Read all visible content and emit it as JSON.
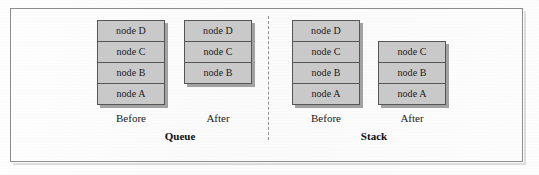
{
  "figure": {
    "background_color": "#fdfdfd",
    "frame_color": "#8c8c8c",
    "divider_style": "dashed-vertical",
    "node_fill_color": "#c9c9c9",
    "node_border_color": "#555555",
    "shadow_color": "#5a5a5a"
  },
  "queue": {
    "title": "Queue",
    "before": {
      "caption": "Before",
      "nodes": [
        "node D",
        "node C",
        "node B",
        "node A"
      ],
      "align": "top"
    },
    "after": {
      "caption": "After",
      "nodes": [
        "node D",
        "node C",
        "node B"
      ],
      "align": "top"
    }
  },
  "stack": {
    "title": "Stack",
    "before": {
      "caption": "Before",
      "nodes": [
        "node D",
        "node C",
        "node B",
        "node A"
      ],
      "align": "top"
    },
    "after": {
      "caption": "After",
      "nodes": [
        "node C",
        "node B",
        "node A"
      ],
      "align": "bottom"
    }
  }
}
